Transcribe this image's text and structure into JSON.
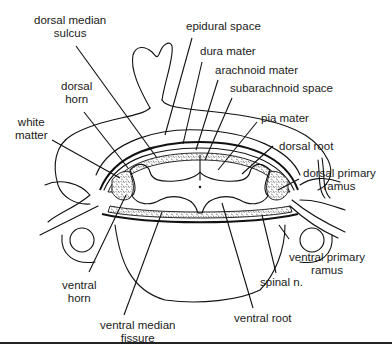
{
  "diagram": {
    "type": "anatomical cross-section",
    "labels": {
      "dorsal_median_sulcus": "dorsal median sulcus",
      "epidural_space": "epidural space",
      "dura_mater": "dura mater",
      "arachnoid_mater": "arachnoid mater",
      "subarachnoid_space": "subarachnoid space",
      "pia_mater": "pia mater",
      "dorsal_horn": "dorsal horn",
      "white_matter": "white matter",
      "dorsal_root": "dorsal root",
      "dorsal_primary_ramus": "dorsal primary ramus",
      "ventral_primary_ramus": "ventral primary ramus",
      "spinal_n": "spinal n.",
      "ventral_horn": "ventral horn",
      "ventral_median_fissure": "ventral median fissure",
      "ventral_root": "ventral root"
    },
    "label_lines": {
      "dorsal_median_sulcus": [
        "dorsal median",
        "sulcus"
      ],
      "dorsal_horn": [
        "dorsal",
        "horn"
      ],
      "white_matter": [
        "white",
        "matter"
      ],
      "dorsal_primary_ramus": [
        "dorsal primary",
        "ramus"
      ],
      "ventral_primary_ramus": [
        "ventral primary",
        "ramus"
      ],
      "ventral_horn": [
        "ventral",
        "horn"
      ],
      "ventral_median_fissure": [
        "ventral median",
        "fissure"
      ]
    }
  }
}
